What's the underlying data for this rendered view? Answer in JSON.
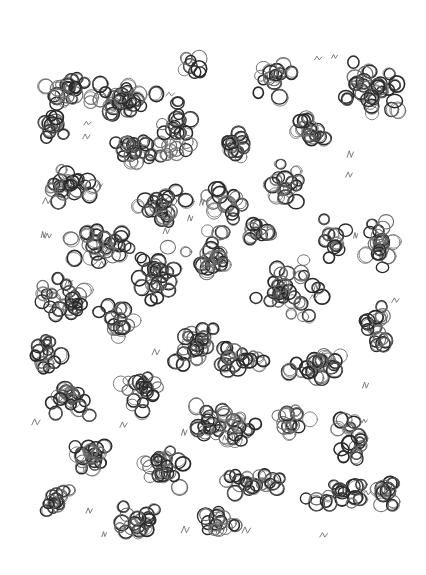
{
  "artwork": {
    "description": "Hand-drawn pen sketch of clustered overlapping small circles on white paper",
    "background_color": "#ffffff",
    "ink_color": "#2a2a2a",
    "light_ink_color": "#6e6e6e",
    "width": 426,
    "height": 575,
    "circle_radius_range": [
      5,
      8
    ],
    "seed": 1337,
    "clusters": [
      {
        "cx": 70,
        "cy": 90,
        "rx": 30,
        "ry": 25,
        "n": 22
      },
      {
        "cx": 55,
        "cy": 125,
        "rx": 18,
        "ry": 22,
        "n": 12
      },
      {
        "cx": 120,
        "cy": 100,
        "rx": 45,
        "ry": 22,
        "n": 30
      },
      {
        "cx": 145,
        "cy": 150,
        "rx": 50,
        "ry": 20,
        "n": 28
      },
      {
        "cx": 195,
        "cy": 65,
        "rx": 20,
        "ry": 15,
        "n": 8
      },
      {
        "cx": 180,
        "cy": 125,
        "rx": 22,
        "ry": 35,
        "n": 18
      },
      {
        "cx": 75,
        "cy": 185,
        "rx": 35,
        "ry": 22,
        "n": 24
      },
      {
        "cx": 160,
        "cy": 205,
        "rx": 35,
        "ry": 25,
        "n": 22
      },
      {
        "cx": 235,
        "cy": 145,
        "rx": 20,
        "ry": 18,
        "n": 14
      },
      {
        "cx": 270,
        "cy": 80,
        "rx": 28,
        "ry": 25,
        "n": 16
      },
      {
        "cx": 310,
        "cy": 130,
        "rx": 25,
        "ry": 20,
        "n": 16
      },
      {
        "cx": 370,
        "cy": 90,
        "rx": 35,
        "ry": 35,
        "n": 34
      },
      {
        "cx": 285,
        "cy": 185,
        "rx": 25,
        "ry": 30,
        "n": 18
      },
      {
        "cx": 225,
        "cy": 200,
        "rx": 25,
        "ry": 25,
        "n": 16
      },
      {
        "cx": 100,
        "cy": 245,
        "rx": 45,
        "ry": 22,
        "n": 28
      },
      {
        "cx": 155,
        "cy": 275,
        "rx": 25,
        "ry": 45,
        "n": 24
      },
      {
        "cx": 210,
        "cy": 255,
        "rx": 25,
        "ry": 35,
        "n": 22
      },
      {
        "cx": 260,
        "cy": 230,
        "rx": 20,
        "ry": 20,
        "n": 12
      },
      {
        "cx": 290,
        "cy": 290,
        "rx": 40,
        "ry": 35,
        "n": 32
      },
      {
        "cx": 330,
        "cy": 240,
        "rx": 20,
        "ry": 25,
        "n": 12
      },
      {
        "cx": 380,
        "cy": 240,
        "rx": 20,
        "ry": 40,
        "n": 20
      },
      {
        "cx": 65,
        "cy": 300,
        "rx": 35,
        "ry": 25,
        "n": 26
      },
      {
        "cx": 115,
        "cy": 320,
        "rx": 25,
        "ry": 25,
        "n": 16
      },
      {
        "cx": 50,
        "cy": 355,
        "rx": 30,
        "ry": 25,
        "n": 16
      },
      {
        "cx": 195,
        "cy": 345,
        "rx": 30,
        "ry": 30,
        "n": 24
      },
      {
        "cx": 245,
        "cy": 360,
        "rx": 30,
        "ry": 20,
        "n": 18
      },
      {
        "cx": 320,
        "cy": 365,
        "rx": 40,
        "ry": 20,
        "n": 22
      },
      {
        "cx": 375,
        "cy": 330,
        "rx": 25,
        "ry": 30,
        "n": 18
      },
      {
        "cx": 70,
        "cy": 400,
        "rx": 30,
        "ry": 20,
        "n": 20
      },
      {
        "cx": 140,
        "cy": 390,
        "rx": 30,
        "ry": 25,
        "n": 20
      },
      {
        "cx": 225,
        "cy": 425,
        "rx": 50,
        "ry": 25,
        "n": 34
      },
      {
        "cx": 290,
        "cy": 420,
        "rx": 25,
        "ry": 20,
        "n": 14
      },
      {
        "cx": 350,
        "cy": 440,
        "rx": 20,
        "ry": 30,
        "n": 18
      },
      {
        "cx": 85,
        "cy": 455,
        "rx": 35,
        "ry": 20,
        "n": 20
      },
      {
        "cx": 160,
        "cy": 470,
        "rx": 35,
        "ry": 25,
        "n": 24
      },
      {
        "cx": 250,
        "cy": 485,
        "rx": 45,
        "ry": 15,
        "n": 22
      },
      {
        "cx": 340,
        "cy": 495,
        "rx": 40,
        "ry": 18,
        "n": 20
      },
      {
        "cx": 55,
        "cy": 505,
        "rx": 25,
        "ry": 20,
        "n": 14
      },
      {
        "cx": 140,
        "cy": 520,
        "rx": 30,
        "ry": 25,
        "n": 20
      },
      {
        "cx": 215,
        "cy": 525,
        "rx": 30,
        "ry": 18,
        "n": 16
      },
      {
        "cx": 385,
        "cy": 495,
        "rx": 20,
        "ry": 25,
        "n": 12
      }
    ],
    "squiggle_count": 45
  }
}
